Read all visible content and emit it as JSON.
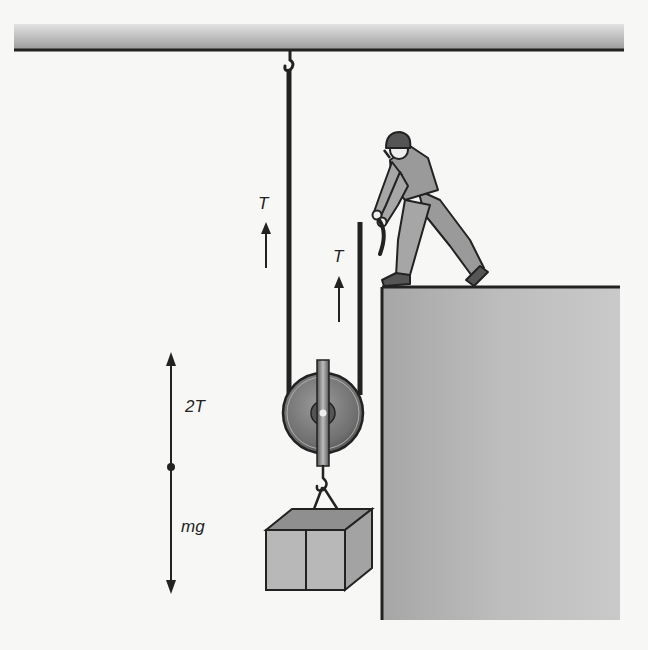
{
  "figure": {
    "type": "physics-diagram"
  },
  "labels": {
    "tension_left": "T",
    "tension_right": "T",
    "free_body_up": "2T",
    "free_body_down": "mg"
  },
  "colors": {
    "background": "#f7f7f5",
    "ceiling": "#b5b5b5",
    "rope": "#222222",
    "wall": "#b4b4b4",
    "crate_front": "#b8b8b8",
    "crate_top": "#8f8f8f",
    "crate_side": "#a3a3a3",
    "pulley": "#7d7d7d",
    "worker_clothes": "#9a9a9a"
  }
}
